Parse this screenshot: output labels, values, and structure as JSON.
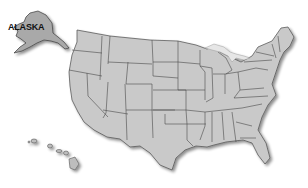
{
  "map": {
    "title": "United States",
    "style": "grayscale state outline map",
    "colors": {
      "background": "#ffffff",
      "state_fill": "#c9c9c9",
      "state_border": "#4a4a4a",
      "alaska_fill": "#a9a9a9",
      "lakes": "#e6e6e6"
    },
    "labels": {
      "alaska": "ALASKA"
    },
    "regions": [
      "Alaska",
      "Hawaii",
      "Contiguous United States"
    ]
  }
}
